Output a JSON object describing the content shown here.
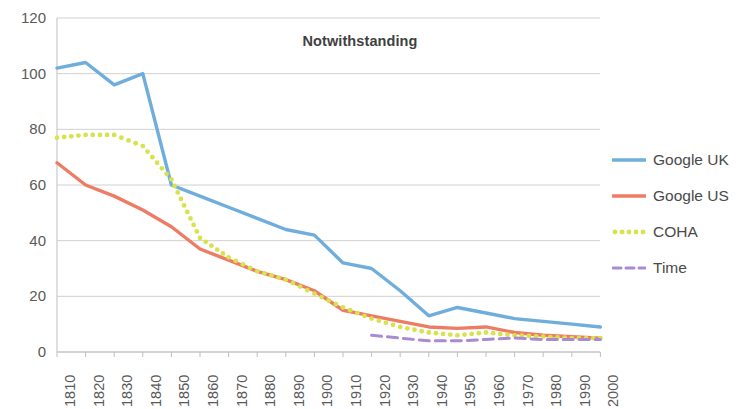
{
  "chart_data": {
    "type": "line",
    "title": "Notwithstanding",
    "xlabel": "",
    "ylabel": "",
    "ylim": [
      0,
      120
    ],
    "ytick_values": [
      0,
      20,
      40,
      60,
      80,
      100,
      120
    ],
    "grid": true,
    "legend_position": "right",
    "categories": [
      "1810",
      "1820",
      "1830",
      "1840",
      "1850",
      "1860",
      "1870",
      "1880",
      "1890",
      "1900",
      "1910",
      "1920",
      "1930",
      "1940",
      "1950",
      "1960",
      "1970",
      "1980",
      "1990",
      "2000"
    ],
    "series": [
      {
        "name": "Google UK",
        "color": "#6FAEDC",
        "style": "solid",
        "values": [
          102,
          104,
          96,
          100,
          60,
          56,
          52,
          48,
          44,
          42,
          32,
          30,
          22,
          13,
          16,
          14,
          12,
          11,
          10,
          9
        ]
      },
      {
        "name": "Google US",
        "color": "#EE7C64",
        "style": "solid",
        "values": [
          68,
          60,
          56,
          51,
          45,
          37,
          33,
          29,
          26,
          22,
          15,
          13,
          11,
          9,
          8.5,
          9,
          7,
          6,
          5.5,
          5
        ]
      },
      {
        "name": "COHA",
        "color": "#D7E24C",
        "style": "dotted",
        "values": [
          77,
          78,
          78,
          74,
          62,
          41,
          34,
          29,
          26,
          21,
          16,
          12,
          9,
          7,
          6,
          7,
          6,
          5.5,
          5,
          5
        ]
      },
      {
        "name": "Time",
        "color": "#A98BD4",
        "style": "dashed",
        "values": [
          null,
          null,
          null,
          null,
          null,
          null,
          null,
          null,
          null,
          null,
          null,
          6,
          5,
          4,
          4,
          4.5,
          5,
          4.5,
          4.5,
          4.5
        ]
      }
    ]
  },
  "legend": {
    "items": [
      {
        "label": "Google UK"
      },
      {
        "label": "Google US"
      },
      {
        "label": "COHA"
      },
      {
        "label": "Time"
      }
    ]
  },
  "axes": {
    "y_labels": [
      "120",
      "100",
      "80",
      "60",
      "40",
      "20",
      "0"
    ],
    "x_labels": [
      "1810",
      "1820",
      "1830",
      "1840",
      "1850",
      "1860",
      "1870",
      "1880",
      "1890",
      "1900",
      "1910",
      "1920",
      "1930",
      "1940",
      "1950",
      "1960",
      "1970",
      "1980",
      "1990",
      "2000"
    ]
  },
  "colors": {
    "google_uk": "#6FAEDC",
    "google_us": "#EE7C64",
    "coha": "#D7E24C",
    "time": "#A98BD4",
    "grid": "#D0D0D0",
    "axis": "#BFBFBF",
    "text": "#5a5a5a"
  }
}
